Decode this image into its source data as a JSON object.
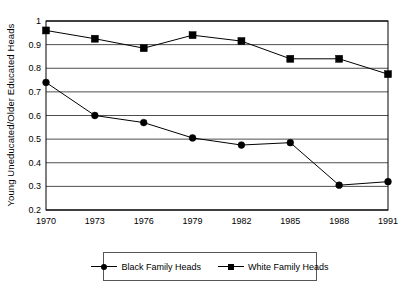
{
  "chart_data": {
    "type": "line",
    "title": "",
    "xlabel": "",
    "ylabel": "Young Uneducated/Older Educated Heads",
    "x": [
      1970,
      1973,
      1976,
      1979,
      1982,
      1985,
      1988,
      1991
    ],
    "xtick_labels": [
      "1970",
      "1973",
      "1976",
      "1979",
      "1982",
      "1985",
      "1988",
      "1991"
    ],
    "ytick_labels": [
      "0.2",
      "0.3",
      "0.4",
      "0.5",
      "0.6",
      "0.7",
      "0.8",
      "0.9",
      "1"
    ],
    "ytick_values": [
      0.2,
      0.3,
      0.4,
      0.5,
      0.6,
      0.7,
      0.8,
      0.9,
      1
    ],
    "ylim": [
      0.2,
      1.0
    ],
    "xlim": [
      1970,
      1991
    ],
    "grid": "horizontal",
    "legend_position": "bottom-center",
    "series": [
      {
        "name": "Black Family Heads",
        "marker": "circle",
        "color": "#000000",
        "values": [
          0.74,
          0.6,
          0.57,
          0.505,
          0.475,
          0.485,
          0.305,
          0.32
        ]
      },
      {
        "name": "White Family Heads",
        "marker": "square",
        "color": "#000000",
        "values": [
          0.96,
          0.925,
          0.885,
          0.94,
          0.915,
          0.84,
          0.84,
          0.775
        ]
      }
    ]
  },
  "legend": {
    "entries": [
      {
        "label": "Black Family Heads",
        "marker": "circle"
      },
      {
        "label": "White Family Heads",
        "marker": "square"
      }
    ]
  }
}
